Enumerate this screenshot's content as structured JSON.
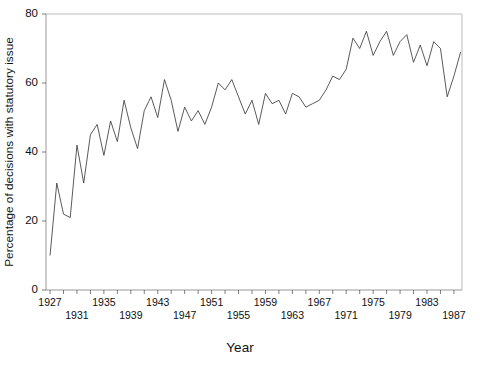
{
  "chart_data": {
    "type": "line",
    "title": "",
    "xlabel": "Year",
    "ylabel": "Percentage of decisions with statutory issue",
    "xlim": [
      1926.4,
      1988.2
    ],
    "ylim": [
      0,
      80
    ],
    "grid": false,
    "legend": null,
    "y_ticks": [
      0,
      20,
      40,
      60,
      80
    ],
    "y_tick_labels": [
      "0",
      "20",
      "40",
      "60",
      "80"
    ],
    "x_ticks": [
      1927,
      1929,
      1931,
      1933,
      1935,
      1937,
      1939,
      1941,
      1943,
      1945,
      1947,
      1949,
      1951,
      1953,
      1955,
      1957,
      1959,
      1961,
      1963,
      1965,
      1967,
      1969,
      1971,
      1973,
      1975,
      1977,
      1979,
      1981,
      1983,
      1985,
      1987
    ],
    "x_tick_labels_row1": [
      "1927",
      "1935",
      "1943",
      "1951",
      "1959",
      "1967",
      "1975",
      "1983"
    ],
    "x_tick_labels_row2": [
      "1931",
      "1939",
      "1947",
      "1955",
      "1963",
      "1971",
      "1979",
      "1987"
    ],
    "x_tick_labels_row1_values": [
      1927,
      1935,
      1943,
      1951,
      1959,
      1967,
      1975,
      1983
    ],
    "x_tick_labels_row2_values": [
      1931,
      1939,
      1947,
      1955,
      1963,
      1971,
      1979,
      1987
    ],
    "x": [
      1927,
      1928,
      1929,
      1930,
      1931,
      1932,
      1933,
      1934,
      1935,
      1936,
      1937,
      1938,
      1939,
      1940,
      1941,
      1942,
      1943,
      1944,
      1945,
      1946,
      1947,
      1948,
      1949,
      1950,
      1951,
      1952,
      1953,
      1954,
      1955,
      1956,
      1957,
      1958,
      1959,
      1960,
      1961,
      1962,
      1963,
      1964,
      1965,
      1966,
      1967,
      1968,
      1969,
      1970,
      1971,
      1972,
      1973,
      1974,
      1975,
      1976,
      1977,
      1978,
      1979,
      1980,
      1981,
      1982,
      1983,
      1984,
      1985,
      1986,
      1987,
      1988
    ],
    "values": [
      10,
      31,
      22,
      21,
      42,
      31,
      45,
      48,
      39,
      49,
      43,
      55,
      47,
      41,
      52,
      56,
      50,
      61,
      55,
      46,
      53,
      49,
      52,
      48,
      53,
      60,
      58,
      61,
      56,
      51,
      55,
      48,
      57,
      54,
      55,
      51,
      57,
      56,
      53,
      54,
      55,
      58,
      62,
      61,
      64,
      73,
      70,
      75,
      68,
      72,
      75,
      68,
      72,
      74,
      66,
      71,
      65,
      72,
      70,
      56,
      62,
      69
    ],
    "series_name": "Percentage of decisions with statutory issue",
    "line_color": "#3c3c3c",
    "axis_color": "#8c8c8c",
    "frame_color": "#b4b4b4",
    "background_color": "#ffffff"
  },
  "geometry": {
    "plot_left": 46,
    "plot_right": 462,
    "plot_top": 14,
    "plot_bottom": 290,
    "xlabel_y": 352,
    "ylabel_x": 13
  }
}
